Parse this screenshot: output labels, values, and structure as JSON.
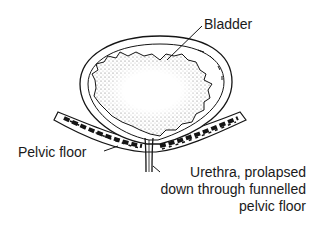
{
  "figure": {
    "colors": {
      "ink": "#151515",
      "background": "#ffffff",
      "stipple": "#555555"
    }
  },
  "labels": {
    "bladder": "Bladder",
    "pelvic_floor": "Pelvic floor",
    "urethra_line1": "Urethra, prolapsed",
    "urethra_line2": "down through funnelled",
    "urethra_line3": "pelvic floor"
  }
}
